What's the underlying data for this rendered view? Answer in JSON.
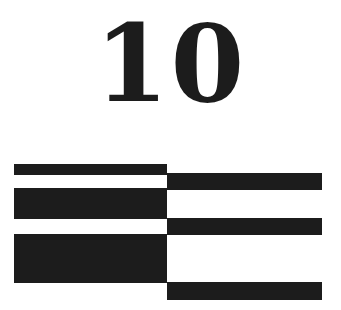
{
  "diagram": {
    "numeral": "10",
    "ink_color": "#1c1c1c",
    "background_color": "#ffffff",
    "left_column": {
      "x": 14,
      "width": 153,
      "bars": [
        {
          "y": 164,
          "height": 11
        },
        {
          "y": 188,
          "height": 31
        },
        {
          "y": 234,
          "height": 49
        }
      ]
    },
    "right_column": {
      "x": 167,
      "width": 155,
      "bars": [
        {
          "y": 173,
          "height": 17
        },
        {
          "y": 218,
          "height": 17
        },
        {
          "y": 282,
          "height": 18
        }
      ]
    }
  }
}
